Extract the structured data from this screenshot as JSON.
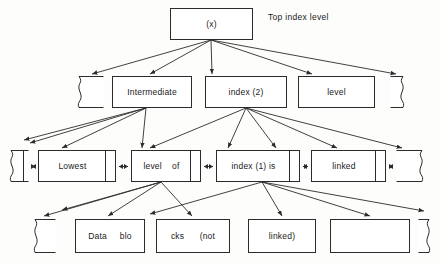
{
  "figure": {
    "caption": "Top index level",
    "caption_pos": {
      "x": 268,
      "y": 12
    },
    "background": "#fdfdfc",
    "ink": "#2b2b2b"
  },
  "rows": {
    "top": {
      "nodes": [
        {
          "name": "node-top-index",
          "label": "(x)",
          "x": 170,
          "y": 8,
          "w": 83,
          "h": 32,
          "kind": "plain"
        }
      ]
    },
    "intermediate": {
      "nodes": [
        {
          "name": "node-intermediate-torn-left",
          "label": "",
          "x": 76,
          "y": 76,
          "w": 28,
          "h": 32,
          "kind": "torn-left"
        },
        {
          "name": "node-intermediate",
          "label": "Intermediate",
          "x": 112,
          "y": 76,
          "w": 80,
          "h": 32,
          "kind": "plain"
        },
        {
          "name": "node-index-2",
          "label": "index (2)",
          "x": 205,
          "y": 76,
          "w": 82,
          "h": 32,
          "kind": "plain"
        },
        {
          "name": "node-level",
          "label": "level",
          "x": 298,
          "y": 76,
          "w": 77,
          "h": 32,
          "kind": "plain"
        },
        {
          "name": "node-intermediate-torn-right",
          "label": "",
          "x": 390,
          "y": 76,
          "w": 16,
          "h": 32,
          "kind": "torn-right"
        }
      ]
    },
    "lowest": {
      "nodes": [
        {
          "name": "node-lowest-torn-left",
          "label": "",
          "x": 8,
          "y": 150,
          "w": 21,
          "h": 32,
          "kind": "torn-left-split"
        },
        {
          "name": "node-lowest",
          "label": "Lowest",
          "x": 38,
          "y": 150,
          "w": 78,
          "h": 32,
          "kind": "split"
        },
        {
          "name": "node-level-of",
          "label": "level    of",
          "x": 131,
          "y": 150,
          "w": 70,
          "h": 32,
          "kind": "split"
        },
        {
          "name": "node-index-1-is",
          "label": "index (1) is",
          "x": 216,
          "y": 150,
          "w": 84,
          "h": 32,
          "kind": "split"
        },
        {
          "name": "node-linked",
          "label": "linked",
          "x": 311,
          "y": 150,
          "w": 75,
          "h": 32,
          "kind": "split"
        },
        {
          "name": "node-lowest-torn-right",
          "label": "",
          "x": 396,
          "y": 150,
          "w": 29,
          "h": 32,
          "kind": "torn-right"
        }
      ],
      "connectors": [
        {
          "name": "connector-torn-to-lowest",
          "x": 29,
          "y": 166,
          "w": 9
        },
        {
          "name": "connector-lowest-to-level-of",
          "x": 116,
          "y": 166,
          "w": 15
        },
        {
          "name": "connector-level-of-to-index-1",
          "x": 201,
          "y": 166,
          "w": 15
        },
        {
          "name": "connector-index-1-to-linked",
          "x": 300,
          "y": 166,
          "w": 11
        },
        {
          "name": "connector-linked-to-torn",
          "x": 386,
          "y": 166,
          "w": 10
        }
      ]
    },
    "data": {
      "nodes": [
        {
          "name": "node-data-torn-left",
          "label": "",
          "x": 32,
          "y": 219,
          "w": 24,
          "h": 34,
          "kind": "torn-left"
        },
        {
          "name": "node-data-blo",
          "label": "Data     blo",
          "x": 75,
          "y": 219,
          "w": 70,
          "h": 34,
          "kind": "plain"
        },
        {
          "name": "node-cks-not",
          "label": "cks      (not",
          "x": 156,
          "y": 219,
          "w": 74,
          "h": 34,
          "kind": "plain"
        },
        {
          "name": "node-linked-close",
          "label": "linked)",
          "x": 248,
          "y": 219,
          "w": 68,
          "h": 34,
          "kind": "plain"
        },
        {
          "name": "node-data-empty",
          "label": "",
          "x": 330,
          "y": 219,
          "w": 80,
          "h": 34,
          "kind": "plain"
        },
        {
          "name": "node-data-torn-right",
          "label": "",
          "x": 418,
          "y": 219,
          "w": 14,
          "h": 34,
          "kind": "torn-right"
        }
      ]
    }
  },
  "edges": [
    {
      "name": "edge-top-to-torn-left",
      "x1": 211,
      "y1": 40,
      "x2": 92,
      "y2": 74
    },
    {
      "name": "edge-top-to-intermediate",
      "x1": 211,
      "y1": 40,
      "x2": 150,
      "y2": 74
    },
    {
      "name": "edge-top-to-index2",
      "x1": 211,
      "y1": 40,
      "x2": 212,
      "y2": 74
    },
    {
      "name": "edge-top-to-level",
      "x1": 211,
      "y1": 40,
      "x2": 312,
      "y2": 74
    },
    {
      "name": "edge-top-to-torn-right",
      "x1": 211,
      "y1": 40,
      "x2": 396,
      "y2": 74
    },
    {
      "name": "edge-inter-to-far-left",
      "x1": 146,
      "y1": 108,
      "x2": 24,
      "y2": 140
    },
    {
      "name": "edge-inter-to-lowest-a",
      "x1": 146,
      "y1": 108,
      "x2": 30,
      "y2": 143
    },
    {
      "name": "edge-inter-to-lowest",
      "x1": 146,
      "y1": 108,
      "x2": 62,
      "y2": 148
    },
    {
      "name": "edge-inter-to-level-of",
      "x1": 146,
      "y1": 108,
      "x2": 142,
      "y2": 148
    },
    {
      "name": "edge-idx2-to-lowest",
      "x1": 246,
      "y1": 108,
      "x2": 150,
      "y2": 148
    },
    {
      "name": "edge-idx2-to-levelof",
      "x1": 246,
      "y1": 108,
      "x2": 228,
      "y2": 148
    },
    {
      "name": "edge-idx2-to-index1",
      "x1": 246,
      "y1": 108,
      "x2": 276,
      "y2": 148
    },
    {
      "name": "edge-idx2-to-linked",
      "x1": 246,
      "y1": 108,
      "x2": 337,
      "y2": 148
    },
    {
      "name": "edge-idx2-to-torn-right",
      "x1": 246,
      "y1": 108,
      "x2": 402,
      "y2": 148
    },
    {
      "name": "edge-levelof-to-far-left",
      "x1": 161,
      "y1": 182,
      "x2": 62,
      "y2": 210
    },
    {
      "name": "edge-levelof-to-torn",
      "x1": 161,
      "y1": 182,
      "x2": 44,
      "y2": 216
    },
    {
      "name": "edge-levelof-to-data",
      "x1": 161,
      "y1": 182,
      "x2": 108,
      "y2": 216
    },
    {
      "name": "edge-levelof-to-cks",
      "x1": 161,
      "y1": 182,
      "x2": 192,
      "y2": 216
    },
    {
      "name": "edge-idx1-to-data",
      "x1": 262,
      "y1": 182,
      "x2": 150,
      "y2": 214
    },
    {
      "name": "edge-idx1-to-linked-cl",
      "x1": 262,
      "y1": 182,
      "x2": 282,
      "y2": 216
    },
    {
      "name": "edge-idx1-to-empty",
      "x1": 262,
      "y1": 182,
      "x2": 370,
      "y2": 216
    },
    {
      "name": "edge-idx1-to-torn-right",
      "x1": 262,
      "y1": 182,
      "x2": 424,
      "y2": 211
    }
  ]
}
